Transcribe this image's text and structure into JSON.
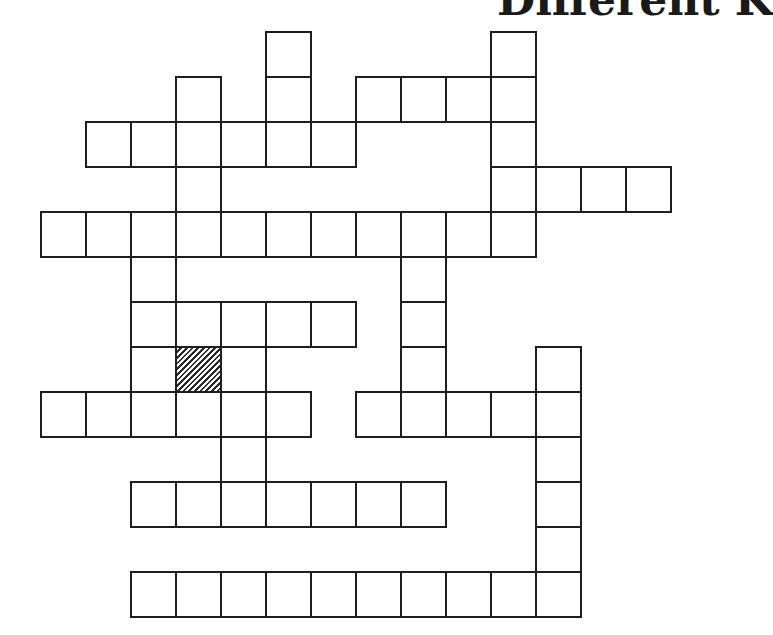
{
  "page": {
    "title_partial": "Different K"
  },
  "crossword": {
    "cell_size": 45,
    "origin_x": 41,
    "origin_y": 32,
    "cols": 14,
    "rows": 13,
    "cells": [
      {
        "r": 0,
        "c": 5
      },
      {
        "r": 0,
        "c": 10
      },
      {
        "r": 1,
        "c": 3
      },
      {
        "r": 1,
        "c": 5
      },
      {
        "r": 1,
        "c": 7
      },
      {
        "r": 1,
        "c": 8
      },
      {
        "r": 1,
        "c": 9
      },
      {
        "r": 1,
        "c": 10
      },
      {
        "r": 2,
        "c": 1
      },
      {
        "r": 2,
        "c": 2
      },
      {
        "r": 2,
        "c": 3
      },
      {
        "r": 2,
        "c": 4
      },
      {
        "r": 2,
        "c": 5
      },
      {
        "r": 2,
        "c": 6
      },
      {
        "r": 2,
        "c": 10
      },
      {
        "r": 3,
        "c": 3
      },
      {
        "r": 3,
        "c": 10
      },
      {
        "r": 3,
        "c": 11
      },
      {
        "r": 3,
        "c": 12
      },
      {
        "r": 3,
        "c": 13
      },
      {
        "r": 4,
        "c": 0
      },
      {
        "r": 4,
        "c": 1
      },
      {
        "r": 4,
        "c": 2
      },
      {
        "r": 4,
        "c": 3
      },
      {
        "r": 4,
        "c": 4
      },
      {
        "r": 4,
        "c": 5
      },
      {
        "r": 4,
        "c": 6
      },
      {
        "r": 4,
        "c": 7
      },
      {
        "r": 4,
        "c": 8
      },
      {
        "r": 4,
        "c": 9
      },
      {
        "r": 4,
        "c": 10
      },
      {
        "r": 5,
        "c": 2
      },
      {
        "r": 5,
        "c": 8
      },
      {
        "r": 6,
        "c": 2
      },
      {
        "r": 6,
        "c": 3
      },
      {
        "r": 6,
        "c": 4
      },
      {
        "r": 6,
        "c": 5
      },
      {
        "r": 6,
        "c": 6
      },
      {
        "r": 6,
        "c": 8
      },
      {
        "r": 7,
        "c": 2
      },
      {
        "r": 7,
        "c": 3,
        "shaded": true
      },
      {
        "r": 7,
        "c": 4
      },
      {
        "r": 7,
        "c": 8
      },
      {
        "r": 7,
        "c": 11
      },
      {
        "r": 8,
        "c": 0
      },
      {
        "r": 8,
        "c": 1
      },
      {
        "r": 8,
        "c": 2
      },
      {
        "r": 8,
        "c": 3
      },
      {
        "r": 8,
        "c": 4
      },
      {
        "r": 8,
        "c": 5
      },
      {
        "r": 8,
        "c": 7
      },
      {
        "r": 8,
        "c": 8
      },
      {
        "r": 8,
        "c": 9
      },
      {
        "r": 8,
        "c": 10
      },
      {
        "r": 8,
        "c": 11
      },
      {
        "r": 9,
        "c": 4
      },
      {
        "r": 9,
        "c": 11
      },
      {
        "r": 10,
        "c": 2
      },
      {
        "r": 10,
        "c": 3
      },
      {
        "r": 10,
        "c": 4
      },
      {
        "r": 10,
        "c": 5
      },
      {
        "r": 10,
        "c": 6
      },
      {
        "r": 10,
        "c": 7
      },
      {
        "r": 10,
        "c": 8
      },
      {
        "r": 10,
        "c": 11
      },
      {
        "r": 11,
        "c": 11
      },
      {
        "r": 12,
        "c": 2
      },
      {
        "r": 12,
        "c": 3
      },
      {
        "r": 12,
        "c": 4
      },
      {
        "r": 12,
        "c": 5
      },
      {
        "r": 12,
        "c": 6
      },
      {
        "r": 12,
        "c": 7
      },
      {
        "r": 12,
        "c": 8
      },
      {
        "r": 12,
        "c": 9
      },
      {
        "r": 12,
        "c": 10
      },
      {
        "r": 12,
        "c": 11
      }
    ],
    "colors": {
      "line": "#1e1e1e",
      "background": "#ffffff",
      "shade": "#2a2a2a"
    }
  }
}
